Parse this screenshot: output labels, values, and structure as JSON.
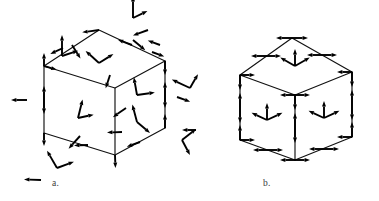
{
  "figure": {
    "background_color": "#ffffff",
    "ink_color": "#000000",
    "edge_color": "#111111",
    "label_color": "#3a3a3a",
    "width": 379,
    "height": 201,
    "caption_a": "a.",
    "caption_b": "b."
  },
  "panels": [
    {
      "id": "panel-a",
      "label": "a.",
      "label_x": 52,
      "label_y": 186,
      "description": "Cube with randomly oriented vectors at vertices, edge midpoints and face centers",
      "cube": {
        "vertices": {
          "front_bottom": [
            115,
            155
          ],
          "front_top": [
            115,
            88
          ],
          "left_bottom": [
            44,
            133
          ],
          "left_top": [
            44,
            66
          ],
          "right_bottom": [
            165,
            128
          ],
          "right_top": [
            165,
            61
          ],
          "back_top": [
            99,
            30
          ],
          "back_hidden": [
            99,
            97
          ]
        }
      }
    },
    {
      "id": "panel-b",
      "label": "b.",
      "label_x": 263,
      "label_y": 186,
      "description": "Cube with symmetric outward-pointing vectors at vertices, edge midpoints and face centers",
      "cube": {
        "vertices": {
          "front_bottom": [
            295,
            160
          ],
          "front_top": [
            295,
            95
          ],
          "left_bottom": [
            240,
            140
          ],
          "left_top": [
            240,
            75
          ],
          "right_bottom": [
            352,
            137
          ],
          "right_top": [
            352,
            72
          ],
          "back_top": [
            292,
            38
          ],
          "back_hidden": [
            292,
            103
          ]
        }
      }
    }
  ],
  "chart_data": {
    "type": "diagram",
    "panel_count": 2,
    "panels": [
      {
        "label": "a.",
        "vector_style": "random",
        "arrows": [
          {
            "x": 62,
            "y": 56,
            "angle": -90,
            "len": 21
          },
          {
            "x": 62,
            "y": 56,
            "angle": -18,
            "len": 17
          },
          {
            "x": 72,
            "y": 45,
            "angle": 58,
            "len": 16
          },
          {
            "x": 44,
            "y": 66,
            "angle": -90,
            "len": 13
          },
          {
            "x": 44,
            "y": 66,
            "angle": 16,
            "len": 13
          },
          {
            "x": 63,
            "y": 48,
            "angle": 155,
            "len": 14
          },
          {
            "x": 99,
            "y": 30,
            "angle": 172,
            "len": 17
          },
          {
            "x": 133,
            "y": 18,
            "angle": -90,
            "len": 22
          },
          {
            "x": 133,
            "y": 18,
            "angle": -26,
            "len": 16
          },
          {
            "x": 133,
            "y": 40,
            "angle": 40,
            "len": 16
          },
          {
            "x": 148,
            "y": 30,
            "angle": 160,
            "len": 16
          },
          {
            "x": 132,
            "y": 45,
            "angle": 200,
            "len": 15
          },
          {
            "x": 160,
            "y": 45,
            "angle": 200,
            "len": 13
          },
          {
            "x": 152,
            "y": 52,
            "angle": 20,
            "len": 13
          },
          {
            "x": 165,
            "y": 61,
            "angle": 90,
            "len": 14
          },
          {
            "x": 165,
            "y": 95,
            "angle": -90,
            "len": 13
          },
          {
            "x": 165,
            "y": 95,
            "angle": 90,
            "len": 13
          },
          {
            "x": 190,
            "y": 88,
            "angle": 205,
            "len": 20
          },
          {
            "x": 190,
            "y": 88,
            "angle": 300,
            "len": 16
          },
          {
            "x": 177,
            "y": 97,
            "angle": 20,
            "len": 14
          },
          {
            "x": 165,
            "y": 128,
            "angle": -90,
            "len": 14
          },
          {
            "x": 182,
            "y": 140,
            "angle": -38,
            "len": 18
          },
          {
            "x": 182,
            "y": 140,
            "angle": 62,
            "len": 17
          },
          {
            "x": 196,
            "y": 130,
            "angle": 180,
            "len": 14
          },
          {
            "x": 140,
            "y": 142,
            "angle": 160,
            "len": 14
          },
          {
            "x": 115,
            "y": 155,
            "angle": 88,
            "len": 13
          },
          {
            "x": 88,
            "y": 145,
            "angle": 178,
            "len": 14
          },
          {
            "x": 57,
            "y": 168,
            "angle": -120,
            "len": 20
          },
          {
            "x": 57,
            "y": 168,
            "angle": -20,
            "len": 18
          },
          {
            "x": 41,
            "y": 180,
            "angle": 182,
            "len": 17
          },
          {
            "x": 44,
            "y": 133,
            "angle": 90,
            "len": 13
          },
          {
            "x": 44,
            "y": 100,
            "angle": -90,
            "len": 14
          },
          {
            "x": 44,
            "y": 100,
            "angle": 90,
            "len": 14
          },
          {
            "x": 27,
            "y": 100,
            "angle": 180,
            "len": 16
          },
          {
            "x": 99,
            "y": 63,
            "angle": -138,
            "len": 18
          },
          {
            "x": 99,
            "y": 63,
            "angle": -32,
            "len": 17
          },
          {
            "x": 110,
            "y": 75,
            "angle": 108,
            "len": 14
          },
          {
            "x": 78,
            "y": 118,
            "angle": -76,
            "len": 19
          },
          {
            "x": 78,
            "y": 118,
            "angle": -12,
            "len": 16
          },
          {
            "x": 80,
            "y": 136,
            "angle": 132,
            "len": 17
          },
          {
            "x": 137,
            "y": 95,
            "angle": -100,
            "len": 18
          },
          {
            "x": 137,
            "y": 95,
            "angle": -8,
            "len": 18
          },
          {
            "x": 126,
            "y": 108,
            "angle": 145,
            "len": 16
          },
          {
            "x": 137,
            "y": 122,
            "angle": -105,
            "len": 18
          },
          {
            "x": 137,
            "y": 122,
            "angle": 40,
            "len": 17
          },
          {
            "x": 122,
            "y": 132,
            "angle": 178,
            "len": 15
          }
        ]
      },
      {
        "label": "b.",
        "vector_style": "symmetric-outward",
        "arrows": [
          {
            "x": 292,
            "y": 38,
            "angle": 180,
            "len": 16
          },
          {
            "x": 292,
            "y": 38,
            "angle": 0,
            "len": 16
          },
          {
            "x": 266,
            "y": 56,
            "angle": 180,
            "len": 15
          },
          {
            "x": 266,
            "y": 56,
            "angle": 0,
            "len": 15
          },
          {
            "x": 322,
            "y": 55,
            "angle": 180,
            "len": 15
          },
          {
            "x": 322,
            "y": 55,
            "angle": 0,
            "len": 15
          },
          {
            "x": 240,
            "y": 75,
            "angle": 90,
            "len": 15
          },
          {
            "x": 240,
            "y": 75,
            "angle": 0,
            "len": 15
          },
          {
            "x": 352,
            "y": 72,
            "angle": 90,
            "len": 15
          },
          {
            "x": 352,
            "y": 72,
            "angle": 180,
            "len": 15
          },
          {
            "x": 295,
            "y": 95,
            "angle": 90,
            "len": 15
          },
          {
            "x": 295,
            "y": 95,
            "angle": 180,
            "len": 15
          },
          {
            "x": 295,
            "y": 95,
            "angle": 0,
            "len": 15
          },
          {
            "x": 240,
            "y": 108,
            "angle": -90,
            "len": 15
          },
          {
            "x": 240,
            "y": 108,
            "angle": 90,
            "len": 15
          },
          {
            "x": 352,
            "y": 105,
            "angle": -90,
            "len": 15
          },
          {
            "x": 352,
            "y": 105,
            "angle": 90,
            "len": 15
          },
          {
            "x": 295,
            "y": 128,
            "angle": -90,
            "len": 15
          },
          {
            "x": 295,
            "y": 128,
            "angle": 90,
            "len": 15
          },
          {
            "x": 240,
            "y": 140,
            "angle": -90,
            "len": 15
          },
          {
            "x": 240,
            "y": 140,
            "angle": 0,
            "len": 15
          },
          {
            "x": 352,
            "y": 137,
            "angle": -90,
            "len": 15
          },
          {
            "x": 352,
            "y": 137,
            "angle": 180,
            "len": 15
          },
          {
            "x": 268,
            "y": 150,
            "angle": 180,
            "len": 15
          },
          {
            "x": 268,
            "y": 150,
            "angle": 0,
            "len": 15
          },
          {
            "x": 324,
            "y": 149,
            "angle": 180,
            "len": 15
          },
          {
            "x": 324,
            "y": 149,
            "angle": 0,
            "len": 15
          },
          {
            "x": 295,
            "y": 160,
            "angle": 180,
            "len": 15
          },
          {
            "x": 295,
            "y": 160,
            "angle": 0,
            "len": 15
          },
          {
            "x": 295,
            "y": 66,
            "angle": -90,
            "len": 17
          },
          {
            "x": 295,
            "y": 66,
            "angle": 210,
            "len": 17
          },
          {
            "x": 295,
            "y": 66,
            "angle": -30,
            "len": 17
          },
          {
            "x": 267,
            "y": 120,
            "angle": -90,
            "len": 17
          },
          {
            "x": 267,
            "y": 120,
            "angle": 205,
            "len": 17
          },
          {
            "x": 267,
            "y": 120,
            "angle": -25,
            "len": 17
          },
          {
            "x": 324,
            "y": 118,
            "angle": -90,
            "len": 17
          },
          {
            "x": 324,
            "y": 118,
            "angle": 205,
            "len": 17
          },
          {
            "x": 324,
            "y": 118,
            "angle": -25,
            "len": 17
          }
        ]
      }
    ]
  }
}
